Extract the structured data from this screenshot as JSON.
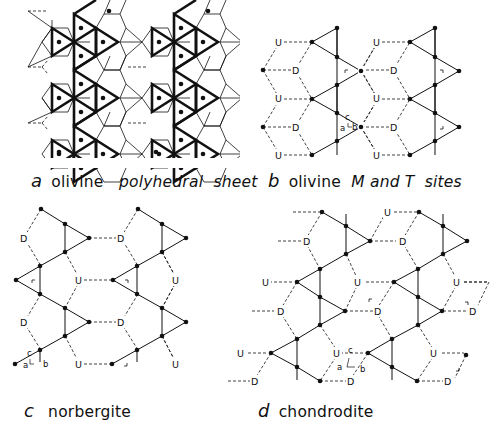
{
  "figure": {
    "panels": [
      {
        "id": "a",
        "letter": "a",
        "caption_parts": [
          "olivine",
          "polyhedral",
          "sheet"
        ],
        "caption_italic_parts": [
          false,
          true,
          true
        ],
        "description": "olivine polyhedral sheet with bold tetrahedra, thin octahedra and dots"
      },
      {
        "id": "b",
        "letter": "b",
        "caption_parts": [
          "olivine",
          "M and T",
          "sites"
        ],
        "caption_italic_parts": [
          false,
          true,
          true
        ],
        "site_labels": [
          "U",
          "D"
        ],
        "axes": {
          "c": "c",
          "a": "a",
          "b": "b"
        }
      },
      {
        "id": "c",
        "letter": "c",
        "caption_parts": [
          "norbergite"
        ],
        "caption_italic_parts": [
          false
        ],
        "site_labels": [
          "U",
          "D"
        ],
        "axes": {
          "c": "c",
          "a": "a",
          "b": "b"
        }
      },
      {
        "id": "d",
        "letter": "d",
        "caption_parts": [
          "chondrodite"
        ],
        "caption_italic_parts": [
          false
        ],
        "site_labels": [
          "U",
          "D"
        ],
        "axes": {
          "c": "c",
          "a": "a",
          "b": "b"
        }
      }
    ],
    "label_U": "U",
    "label_D": "D",
    "axis_c": "c",
    "axis_a": "a",
    "axis_b": "b",
    "colors": {
      "ink": "#111111",
      "background": "#ffffff"
    }
  }
}
